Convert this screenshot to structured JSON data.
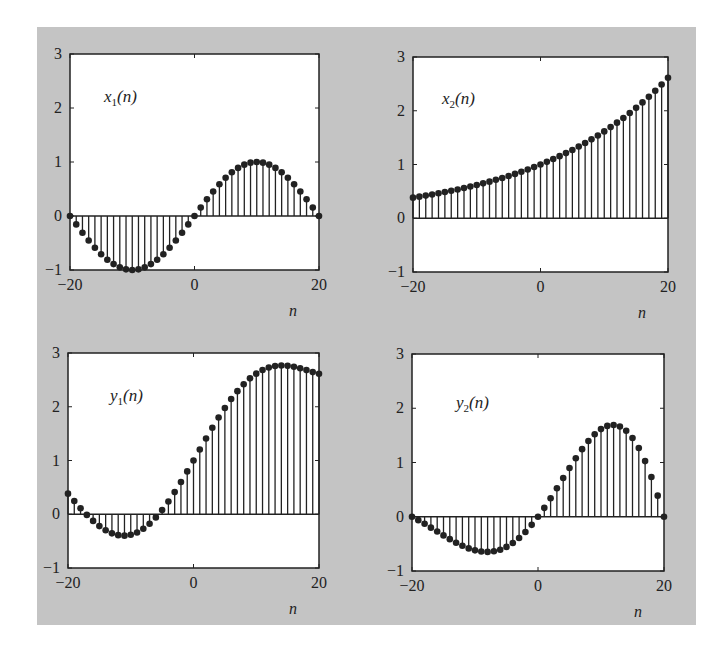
{
  "chart_data": [
    {
      "type": "stem",
      "title": "x1(n)",
      "label": {
        "main": "x",
        "sub": "1",
        "arg": "(n)"
      },
      "xlabel": "n",
      "ylabel": "",
      "xlim": [
        -20,
        20
      ],
      "ylim": [
        -1,
        3
      ],
      "xticks": [
        -20,
        0,
        20
      ],
      "yticks": [
        -1,
        0,
        1,
        2,
        3
      ],
      "grid": false,
      "x": [
        -20,
        -19,
        -18,
        -17,
        -16,
        -15,
        -14,
        -13,
        -12,
        -11,
        -10,
        -9,
        -8,
        -7,
        -6,
        -5,
        -4,
        -3,
        -2,
        -1,
        0,
        1,
        2,
        3,
        4,
        5,
        6,
        7,
        8,
        9,
        10,
        11,
        12,
        13,
        14,
        15,
        16,
        17,
        18,
        19,
        20
      ],
      "values": [
        0,
        -0.156,
        -0.309,
        -0.454,
        -0.588,
        -0.707,
        -0.809,
        -0.891,
        -0.951,
        -0.988,
        -1,
        -0.988,
        -0.951,
        -0.891,
        -0.809,
        -0.707,
        -0.588,
        -0.454,
        -0.309,
        -0.156,
        0,
        0.156,
        0.309,
        0.454,
        0.588,
        0.707,
        0.809,
        0.891,
        0.951,
        0.988,
        1,
        0.988,
        0.951,
        0.891,
        0.809,
        0.707,
        0.588,
        0.454,
        0.309,
        0.156,
        0
      ]
    },
    {
      "type": "stem",
      "title": "x2(n)",
      "label": {
        "main": "x",
        "sub": "2",
        "arg": "(n)"
      },
      "xlabel": "n",
      "ylabel": "",
      "xlim": [
        -20,
        20
      ],
      "ylim": [
        -1,
        3
      ],
      "xticks": [
        -20,
        0,
        20
      ],
      "yticks": [
        -1,
        0,
        1,
        2,
        3
      ],
      "grid": false,
      "x": [
        -20,
        -19,
        -18,
        -17,
        -16,
        -15,
        -14,
        -13,
        -12,
        -11,
        -10,
        -9,
        -8,
        -7,
        -6,
        -5,
        -4,
        -3,
        -2,
        -1,
        0,
        1,
        2,
        3,
        4,
        5,
        6,
        7,
        8,
        9,
        10,
        11,
        12,
        13,
        14,
        15,
        16,
        17,
        18,
        19,
        20
      ],
      "values": [
        0.383,
        0.402,
        0.421,
        0.442,
        0.464,
        0.487,
        0.511,
        0.536,
        0.562,
        0.59,
        0.619,
        0.649,
        0.681,
        0.715,
        0.75,
        0.787,
        0.825,
        0.866,
        0.908,
        0.953,
        1.0,
        1.049,
        1.101,
        1.155,
        1.212,
        1.271,
        1.334,
        1.399,
        1.468,
        1.54,
        1.616,
        1.696,
        1.779,
        1.866,
        1.958,
        2.054,
        2.155,
        2.261,
        2.373,
        2.489,
        2.612
      ]
    },
    {
      "type": "stem",
      "title": "y1(n)",
      "label": {
        "main": "y",
        "sub": "1",
        "arg": "(n)"
      },
      "xlabel": "n",
      "ylabel": "",
      "xlim": [
        -20,
        20
      ],
      "ylim": [
        -1,
        3
      ],
      "xticks": [
        -20,
        0,
        20
      ],
      "yticks": [
        -1,
        0,
        1,
        2,
        3
      ],
      "grid": false,
      "x": [
        -20,
        -19,
        -18,
        -17,
        -16,
        -15,
        -14,
        -13,
        -12,
        -11,
        -10,
        -9,
        -8,
        -7,
        -6,
        -5,
        -4,
        -3,
        -2,
        -1,
        0,
        1,
        2,
        3,
        4,
        5,
        6,
        7,
        8,
        9,
        10,
        11,
        12,
        13,
        14,
        15,
        16,
        17,
        18,
        19,
        20
      ],
      "values": [
        0.383,
        0.246,
        0.112,
        -0.012,
        -0.124,
        -0.22,
        -0.298,
        -0.355,
        -0.389,
        -0.398,
        -0.381,
        -0.339,
        -0.27,
        -0.176,
        -0.059,
        0.08,
        0.237,
        0.412,
        0.599,
        0.797,
        1.0,
        1.205,
        1.41,
        1.609,
        1.8,
        1.978,
        2.143,
        2.29,
        2.419,
        2.528,
        2.616,
        2.684,
        2.73,
        2.757,
        2.767,
        2.761,
        2.743,
        2.715,
        2.682,
        2.645,
        2.612
      ]
    },
    {
      "type": "stem",
      "title": "y2(n)",
      "label": {
        "main": "y",
        "sub": "2",
        "arg": "(n)"
      },
      "xlabel": "n",
      "ylabel": "",
      "xlim": [
        -20,
        20
      ],
      "ylim": [
        -1,
        3
      ],
      "xticks": [
        -20,
        0,
        20
      ],
      "yticks": [
        -1,
        0,
        1,
        2,
        3
      ],
      "grid": false,
      "x": [
        -20,
        -19,
        -18,
        -17,
        -16,
        -15,
        -14,
        -13,
        -12,
        -11,
        -10,
        -9,
        -8,
        -7,
        -6,
        -5,
        -4,
        -3,
        -2,
        -1,
        0,
        1,
        2,
        3,
        4,
        5,
        6,
        7,
        8,
        9,
        10,
        11,
        12,
        13,
        14,
        15,
        16,
        17,
        18,
        19,
        20
      ],
      "values": [
        0,
        -0.063,
        -0.13,
        -0.201,
        -0.273,
        -0.344,
        -0.413,
        -0.478,
        -0.535,
        -0.583,
        -0.619,
        -0.641,
        -0.648,
        -0.637,
        -0.607,
        -0.556,
        -0.485,
        -0.393,
        -0.281,
        -0.149,
        0,
        0.164,
        0.34,
        0.524,
        0.713,
        0.899,
        1.079,
        1.246,
        1.396,
        1.521,
        1.616,
        1.675,
        1.692,
        1.663,
        1.584,
        1.452,
        1.267,
        1.026,
        0.733,
        0.389,
        0
      ]
    }
  ],
  "layout": {
    "panels": [
      {
        "left": 70,
        "top": 54,
        "right": 319,
        "bottom": 270
      },
      {
        "left": 413,
        "top": 57,
        "right": 668,
        "bottom": 272
      },
      {
        "left": 68,
        "top": 353,
        "right": 319,
        "bottom": 568
      },
      {
        "left": 412,
        "top": 354,
        "right": 664,
        "bottom": 571
      }
    ],
    "label_pos": [
      {
        "x": 104,
        "y": 102
      },
      {
        "x": 442,
        "y": 104
      },
      {
        "x": 110,
        "y": 401
      },
      {
        "x": 456,
        "y": 408
      }
    ]
  },
  "colors": {
    "figure_bg": "#c4c4c4",
    "axes_bg": "#ffffff",
    "ink": "#222222"
  }
}
